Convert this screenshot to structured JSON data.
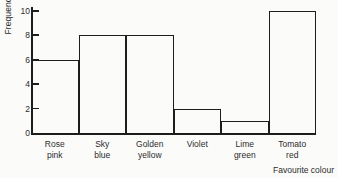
{
  "chart_data": {
    "type": "bar",
    "title": "",
    "subtitle": "",
    "xlabel": "Favourite colour",
    "ylabel": "Frequency",
    "categories": [
      "Rose pink",
      "Sky blue",
      "Golden yellow",
      "Violet",
      "Lime green",
      "Tomato red"
    ],
    "values": [
      6,
      8,
      8,
      2,
      1,
      10
    ],
    "ylim": [
      0,
      10
    ],
    "yticks": [
      0,
      2,
      4,
      6,
      8,
      10
    ],
    "ytick_labels": [
      "0",
      "2",
      "4",
      "6",
      "8",
      "10"
    ],
    "grid": false,
    "legend": null,
    "bars_adjacent": true,
    "bar_fill": "none",
    "line_color": "#1d1d1d",
    "background_color": "#fbfbfa",
    "annotations": []
  }
}
